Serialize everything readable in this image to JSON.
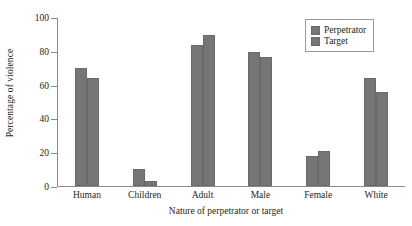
{
  "chart_data": {
    "type": "bar",
    "title": "",
    "xlabel": "Nature of perpetrator or target",
    "ylabel": "Percentage of violence",
    "categories": [
      "Human",
      "Children",
      "Adult",
      "Male",
      "Female",
      "White"
    ],
    "series": [
      {
        "name": "Perpetrator",
        "values": [
          70,
          10,
          84,
          80,
          18,
          64
        ],
        "color": "#767676"
      },
      {
        "name": "Target",
        "values": [
          64,
          3,
          90,
          77,
          21,
          56
        ],
        "color": "#767676"
      }
    ],
    "ylim": [
      0,
      100
    ],
    "yticks": [
      0,
      20,
      40,
      60,
      80,
      100
    ],
    "ytick_labels": [
      "0",
      "20",
      "40",
      "60",
      "80",
      "100"
    ],
    "grid": false,
    "legend_position": "top-right"
  },
  "axis": {
    "ylabel": "Percentage of violence",
    "xlabel": "Nature of perpetrator or target",
    "t0": "0",
    "t20": "20",
    "t40": "40",
    "t60": "60",
    "t80": "80",
    "t100": "100"
  },
  "xcats": {
    "c0": "Human",
    "c1": "Children",
    "c2": "Adult",
    "c3": "Male",
    "c4": "Female",
    "c5": "White"
  },
  "legend": {
    "perpetrator": "Perpetrator",
    "target": "Target"
  }
}
